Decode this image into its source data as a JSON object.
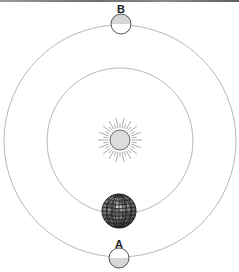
{
  "diagram": {
    "type": "orbit-diagram",
    "center": {
      "x": 120,
      "y": 141
    },
    "sun": {
      "x": 120,
      "y": 140,
      "r": 10,
      "ray_inner": 12,
      "ray_outer": 22,
      "ray_count": 36,
      "fill": "#dcdcdc"
    },
    "inner_orbit": {
      "r": 73,
      "stroke": "#b8b8b8"
    },
    "outer_orbit": {
      "r": 116,
      "stroke": "#b8b8b8"
    },
    "earth": {
      "x": 119,
      "y": 211,
      "r": 17
    },
    "moons": [
      {
        "id": "B",
        "label": "B",
        "x": 121,
        "y": 24,
        "r": 10,
        "shaded_half": "top",
        "label_y": 9
      },
      {
        "id": "A",
        "label": "A",
        "x": 119,
        "y": 258,
        "r": 10,
        "shaded_half": "bottom",
        "label_y": 244
      }
    ],
    "colors": {
      "shade": "#d6d6d6",
      "outline": "#555555",
      "globe_dark": "#444444"
    }
  }
}
